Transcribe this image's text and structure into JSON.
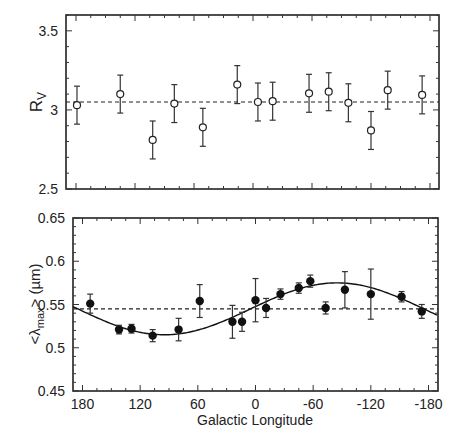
{
  "chart_data": [
    {
      "type": "scatter",
      "panel": "top",
      "title": "",
      "xlabel": "",
      "ylabel": "R_V",
      "ylabel_main": "R",
      "ylabel_sub": "V",
      "xlim": [
        180,
        -180
      ],
      "ylim": [
        2.5,
        3.6
      ],
      "yticks": [
        2.5,
        3,
        3.5
      ],
      "ytick_labels": [
        "2.5",
        "3",
        "3.5"
      ],
      "xticks_major": [
        180,
        120,
        60,
        0,
        -60,
        -120,
        -180
      ],
      "show_xtick_labels": false,
      "grid": false,
      "marker": "open-circle",
      "reference_line": {
        "y": 3.05,
        "style": "dashed"
      },
      "points": [
        {
          "x": 179,
          "y": 3.03,
          "err": 0.12
        },
        {
          "x": 135,
          "y": 3.1,
          "err": 0.12
        },
        {
          "x": 102,
          "y": 2.81,
          "err": 0.12
        },
        {
          "x": 80,
          "y": 3.04,
          "err": 0.12
        },
        {
          "x": 51,
          "y": 2.89,
          "err": 0.12
        },
        {
          "x": 16,
          "y": 3.16,
          "err": 0.12
        },
        {
          "x": -5,
          "y": 3.05,
          "err": 0.12
        },
        {
          "x": -20,
          "y": 3.055,
          "err": 0.12
        },
        {
          "x": -57,
          "y": 3.105,
          "err": 0.12
        },
        {
          "x": -77,
          "y": 3.115,
          "err": 0.12
        },
        {
          "x": -97,
          "y": 3.045,
          "err": 0.12
        },
        {
          "x": -120,
          "y": 2.87,
          "err": 0.12
        },
        {
          "x": -137,
          "y": 3.125,
          "err": 0.12
        },
        {
          "x": -172,
          "y": 3.095,
          "err": 0.12
        }
      ]
    },
    {
      "type": "scatter",
      "panel": "bottom",
      "title": "",
      "xlabel": "Galactic Longitude",
      "ylabel": "<λmax> (µm)",
      "ylabel_lt": "<λ",
      "ylabel_sub": "max",
      "ylabel_gt": ">  (µm)",
      "xlim": [
        180,
        -180
      ],
      "ylim": [
        0.45,
        0.65
      ],
      "yticks": [
        0.45,
        0.5,
        0.55,
        0.6,
        0.65
      ],
      "ytick_labels": [
        "0.45",
        "0.5",
        "0.55",
        "0.6",
        "0.65"
      ],
      "xticks_major": [
        180,
        120,
        60,
        0,
        -60,
        -120,
        -180
      ],
      "xtick_labels": [
        "180",
        "120",
        "60",
        "0",
        "-60",
        "-120",
        "-180"
      ],
      "grid": false,
      "marker": "filled-circle",
      "reference_line": {
        "y": 0.545,
        "style": "dashed"
      },
      "fit_curve": {
        "type": "sinusoid",
        "mean": 0.545,
        "amplitude": 0.03,
        "min_at_longitude": 95,
        "style": "solid"
      },
      "points": [
        {
          "x": 172,
          "y": 0.551,
          "err": 0.011
        },
        {
          "x": 142,
          "y": 0.521,
          "err": 0.005
        },
        {
          "x": 129,
          "y": 0.522,
          "err": 0.005
        },
        {
          "x": 107,
          "y": 0.514,
          "err": 0.007
        },
        {
          "x": 80,
          "y": 0.521,
          "err": 0.013
        },
        {
          "x": 58,
          "y": 0.554,
          "err": 0.019
        },
        {
          "x": 24,
          "y": 0.53,
          "err": 0.019
        },
        {
          "x": 14,
          "y": 0.53,
          "err": 0.011
        },
        {
          "x": 0,
          "y": 0.555,
          "err": 0.025
        },
        {
          "x": -11,
          "y": 0.546,
          "err": 0.011
        },
        {
          "x": -26,
          "y": 0.562,
          "err": 0.006
        },
        {
          "x": -45,
          "y": 0.569,
          "err": 0.006
        },
        {
          "x": -57,
          "y": 0.577,
          "err": 0.007
        },
        {
          "x": -73,
          "y": 0.546,
          "err": 0.007
        },
        {
          "x": -93,
          "y": 0.567,
          "err": 0.021
        },
        {
          "x": -120,
          "y": 0.562,
          "err": 0.029
        },
        {
          "x": -152,
          "y": 0.559,
          "err": 0.006
        },
        {
          "x": -173,
          "y": 0.542,
          "err": 0.008
        }
      ]
    }
  ]
}
